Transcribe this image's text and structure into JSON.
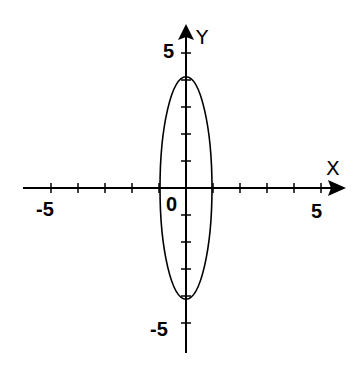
{
  "chart_data": {
    "type": "line",
    "title": "",
    "xlabel": "X",
    "ylabel": "Y",
    "xlim": [
      -6,
      6
    ],
    "ylim": [
      -6,
      6
    ],
    "grid": false,
    "x_ticks": [
      -5,
      -4,
      -3,
      -2,
      -1,
      1,
      2,
      3,
      4,
      5
    ],
    "y_ticks": [
      -5,
      -4,
      -3,
      -2,
      -1,
      1,
      2,
      3,
      4,
      5
    ],
    "tick_labels": {
      "x": [
        {
          "value": -5,
          "label": "-5"
        },
        {
          "value": 5,
          "label": "5"
        }
      ],
      "y": [
        {
          "value": 5,
          "label": "5"
        },
        {
          "value": -5,
          "label": "-5"
        }
      ],
      "origin": "0"
    },
    "series": [
      {
        "name": "ellipse",
        "shape": "ellipse",
        "center": [
          0,
          0
        ],
        "semi_axis_x": 1,
        "semi_axis_y": 4,
        "equation": "x^2/1 + y^2/16 = 1"
      }
    ],
    "colors": {
      "axes": "#000000",
      "curve": "#000000",
      "background": "#ffffff"
    }
  },
  "labels": {
    "x_axis": "X",
    "y_axis": "Y",
    "origin": "0",
    "x_neg5": "-5",
    "x_pos5": "5",
    "y_pos5": "5",
    "y_neg5": "-5"
  }
}
